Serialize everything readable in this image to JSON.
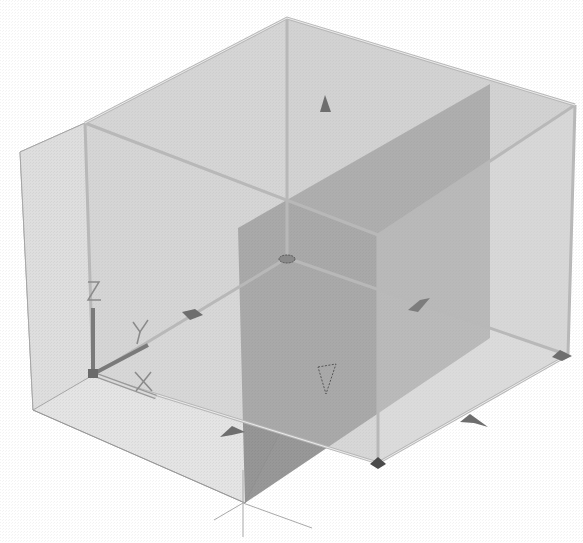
{
  "viewport": {
    "type": "3d-model-view",
    "background": "#ffffff"
  },
  "ucs_icon": {
    "z_label": "Z",
    "y_label": "Y",
    "x_label": "X"
  },
  "colors": {
    "box_face_light": "#d9d9d9",
    "box_face_mid": "#c4c4c4",
    "section_plane": "#8f8f8f",
    "edge": "#b5b5b5",
    "grip": "#6a6a6a"
  },
  "grips": [
    {
      "name": "top-face-grip",
      "shape": "triangle-up"
    },
    {
      "name": "back-bottom-grip",
      "shape": "diamond"
    },
    {
      "name": "left-edge-grip",
      "shape": "arrow"
    },
    {
      "name": "right-edge-grip",
      "shape": "arrow"
    },
    {
      "name": "center-grip",
      "shape": "triangle-down-dashed"
    },
    {
      "name": "front-left-edge-grip",
      "shape": "arrow"
    },
    {
      "name": "front-right-edge-grip",
      "shape": "arrow"
    },
    {
      "name": "right-corner-grip",
      "shape": "diamond"
    },
    {
      "name": "front-corner-grip",
      "shape": "diamond"
    }
  ]
}
